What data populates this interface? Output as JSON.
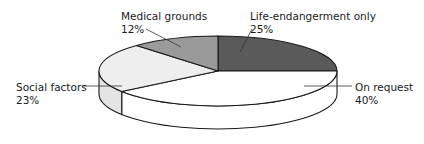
{
  "chart_data": {
    "type": "pie",
    "style": "3d",
    "title": "",
    "categories": [
      "Life-endangerment only",
      "On request",
      "Social factors",
      "Medical grounds"
    ],
    "values": [
      25,
      40,
      23,
      12
    ],
    "unit": "%",
    "labels": [
      {
        "name": "Life-endangerment only",
        "value_text": "25%"
      },
      {
        "name": "On request",
        "value_text": "40%"
      },
      {
        "name": "Social factors",
        "value_text": "23%"
      },
      {
        "name": "Medical grounds",
        "value_text": "12%"
      }
    ],
    "colors": [
      "#5a5a5a",
      "#ffffff",
      "#eeeeee",
      "#9a9a9a"
    ],
    "side_colors": [
      "#3f3f3f",
      "#ffffff",
      "#e4e4e4",
      "#808080"
    ],
    "start_angle_deg": 0,
    "direction": "clockwise",
    "legend": "none",
    "label_placement": "callout"
  }
}
